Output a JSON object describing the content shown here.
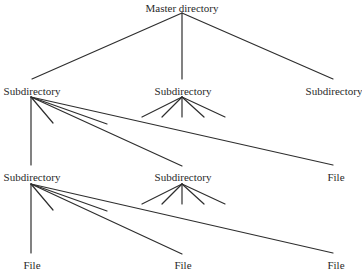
{
  "diagram": {
    "type": "tree",
    "title": "",
    "nodes": {
      "root": {
        "label": "Master directory",
        "x": 182,
        "y": 2
      },
      "l1_left": {
        "label": "Subdirectory",
        "x": 32,
        "y": 85
      },
      "l1_mid": {
        "label": "Subdirectory",
        "x": 183,
        "y": 85
      },
      "l1_right": {
        "label": "Subdirectory",
        "x": 334,
        "y": 85
      },
      "l2_left": {
        "label": "Subdirectory",
        "x": 32,
        "y": 171
      },
      "l2_mid": {
        "label": "Subdirectory",
        "x": 183,
        "y": 171
      },
      "l2_right": {
        "label": "File",
        "x": 336,
        "y": 171
      },
      "l3_left": {
        "label": "File",
        "x": 32,
        "y": 259
      },
      "l3_mid": {
        "label": "File",
        "x": 183,
        "y": 259
      },
      "l3_right": {
        "label": "File",
        "x": 336,
        "y": 259
      }
    },
    "edges": [
      {
        "from": "root",
        "to": "l1_left"
      },
      {
        "from": "root",
        "to": "l1_mid"
      },
      {
        "from": "root",
        "to": "l1_right"
      },
      {
        "from": "l1_left",
        "to": "l2_left"
      },
      {
        "from": "l1_left",
        "to": "l2_mid"
      },
      {
        "from": "l1_left",
        "to": "l2_right"
      },
      {
        "from": "l2_left",
        "to": "l3_left"
      },
      {
        "from": "l2_left",
        "to": "l3_mid"
      },
      {
        "from": "l2_left",
        "to": "l3_right"
      }
    ],
    "stub_edges_note": "Short unlabeled branch stubs indicate additional children (fan of 5 under middle subdirectories, 2 extra under left subdirectories)"
  }
}
